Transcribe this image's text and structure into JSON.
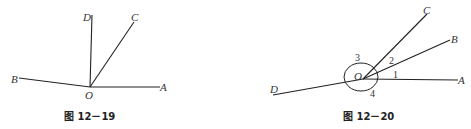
{
  "figures": [
    {
      "caption": "图 12－19",
      "labels": {
        "A": "A",
        "B": "B",
        "C": "C",
        "D": "D",
        "O": "O"
      }
    },
    {
      "caption": "图 12－20",
      "labels": {
        "A": "A",
        "B": "B",
        "C": "C",
        "D": "D",
        "O": "O"
      },
      "angle_marks": [
        "1",
        "2",
        "3",
        "4"
      ]
    }
  ]
}
